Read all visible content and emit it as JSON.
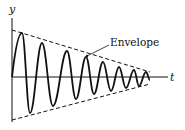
{
  "diagram": {
    "axes": {
      "x_label": "t",
      "y_label": "y"
    },
    "annotation": {
      "text": "Envelope"
    },
    "colors": {
      "line": "#111111",
      "background": "#ffffff"
    },
    "geometry": {
      "origin": [
        12,
        77
      ],
      "y_axis_top": 18,
      "y_axis_bottom": 122,
      "x_axis_end": 168,
      "envelope_upper": [
        [
          12,
          30
        ],
        [
          150,
          72
        ]
      ],
      "envelope_lower": [
        [
          12,
          120
        ],
        [
          150,
          84
        ]
      ],
      "waveform_points": [
        [
          12,
          77
        ],
        [
          22,
          33
        ],
        [
          30,
          113
        ],
        [
          42,
          43
        ],
        [
          53,
          106
        ],
        [
          67,
          51
        ],
        [
          76,
          99
        ],
        [
          86,
          57
        ],
        [
          94,
          94
        ],
        [
          103,
          62
        ],
        [
          111,
          91
        ],
        [
          119,
          67
        ],
        [
          126,
          88
        ],
        [
          134,
          70
        ],
        [
          139,
          86
        ],
        [
          146,
          72
        ],
        [
          150,
          80
        ]
      ]
    }
  }
}
